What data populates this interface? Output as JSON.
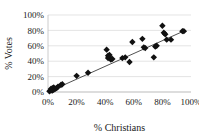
{
  "chart_data": {
    "type": "scatter",
    "title": "",
    "xlabel": "% Christians",
    "ylabel": "% Votes",
    "xlim": [
      0,
      100
    ],
    "ylim": [
      0,
      100
    ],
    "xticks": [
      "0%",
      "20%",
      "40%",
      "60%",
      "80%",
      "100%"
    ],
    "yticks": [
      "0%",
      "20%",
      "40%",
      "60%",
      "80%",
      "100%"
    ],
    "xtick_values": [
      0,
      20,
      40,
      60,
      80,
      100
    ],
    "ytick_values": [
      0,
      20,
      40,
      60,
      80,
      100
    ],
    "grid": "horizontal",
    "legend": "none",
    "marker": "diamond",
    "marker_color": "#111111",
    "series": [
      {
        "name": "Observations",
        "points": [
          [
            1,
            1
          ],
          [
            2,
            2
          ],
          [
            2,
            4
          ],
          [
            3,
            2
          ],
          [
            3,
            5
          ],
          [
            4,
            3
          ],
          [
            4,
            6
          ],
          [
            5,
            4
          ],
          [
            6,
            5
          ],
          [
            7,
            7
          ],
          [
            9,
            9
          ],
          [
            10,
            10
          ],
          [
            20,
            21
          ],
          [
            28,
            25
          ],
          [
            41,
            55
          ],
          [
            42,
            47
          ],
          [
            42,
            44
          ],
          [
            43,
            48
          ],
          [
            43,
            45
          ],
          [
            44,
            42
          ],
          [
            45,
            43
          ],
          [
            52,
            44
          ],
          [
            54,
            45
          ],
          [
            57,
            39
          ],
          [
            59,
            65
          ],
          [
            66,
            69
          ],
          [
            67,
            58
          ],
          [
            68,
            57
          ],
          [
            74,
            45
          ],
          [
            75,
            59
          ],
          [
            76,
            60
          ],
          [
            80,
            86
          ],
          [
            81,
            77
          ],
          [
            82,
            75
          ],
          [
            83,
            68
          ],
          [
            86,
            68
          ],
          [
            94,
            79
          ],
          [
            95,
            79
          ]
        ]
      }
    ],
    "trendline": {
      "type": "linear",
      "x_start": 0,
      "y_start": 0,
      "x_end": 96,
      "y_end": 80
    }
  }
}
